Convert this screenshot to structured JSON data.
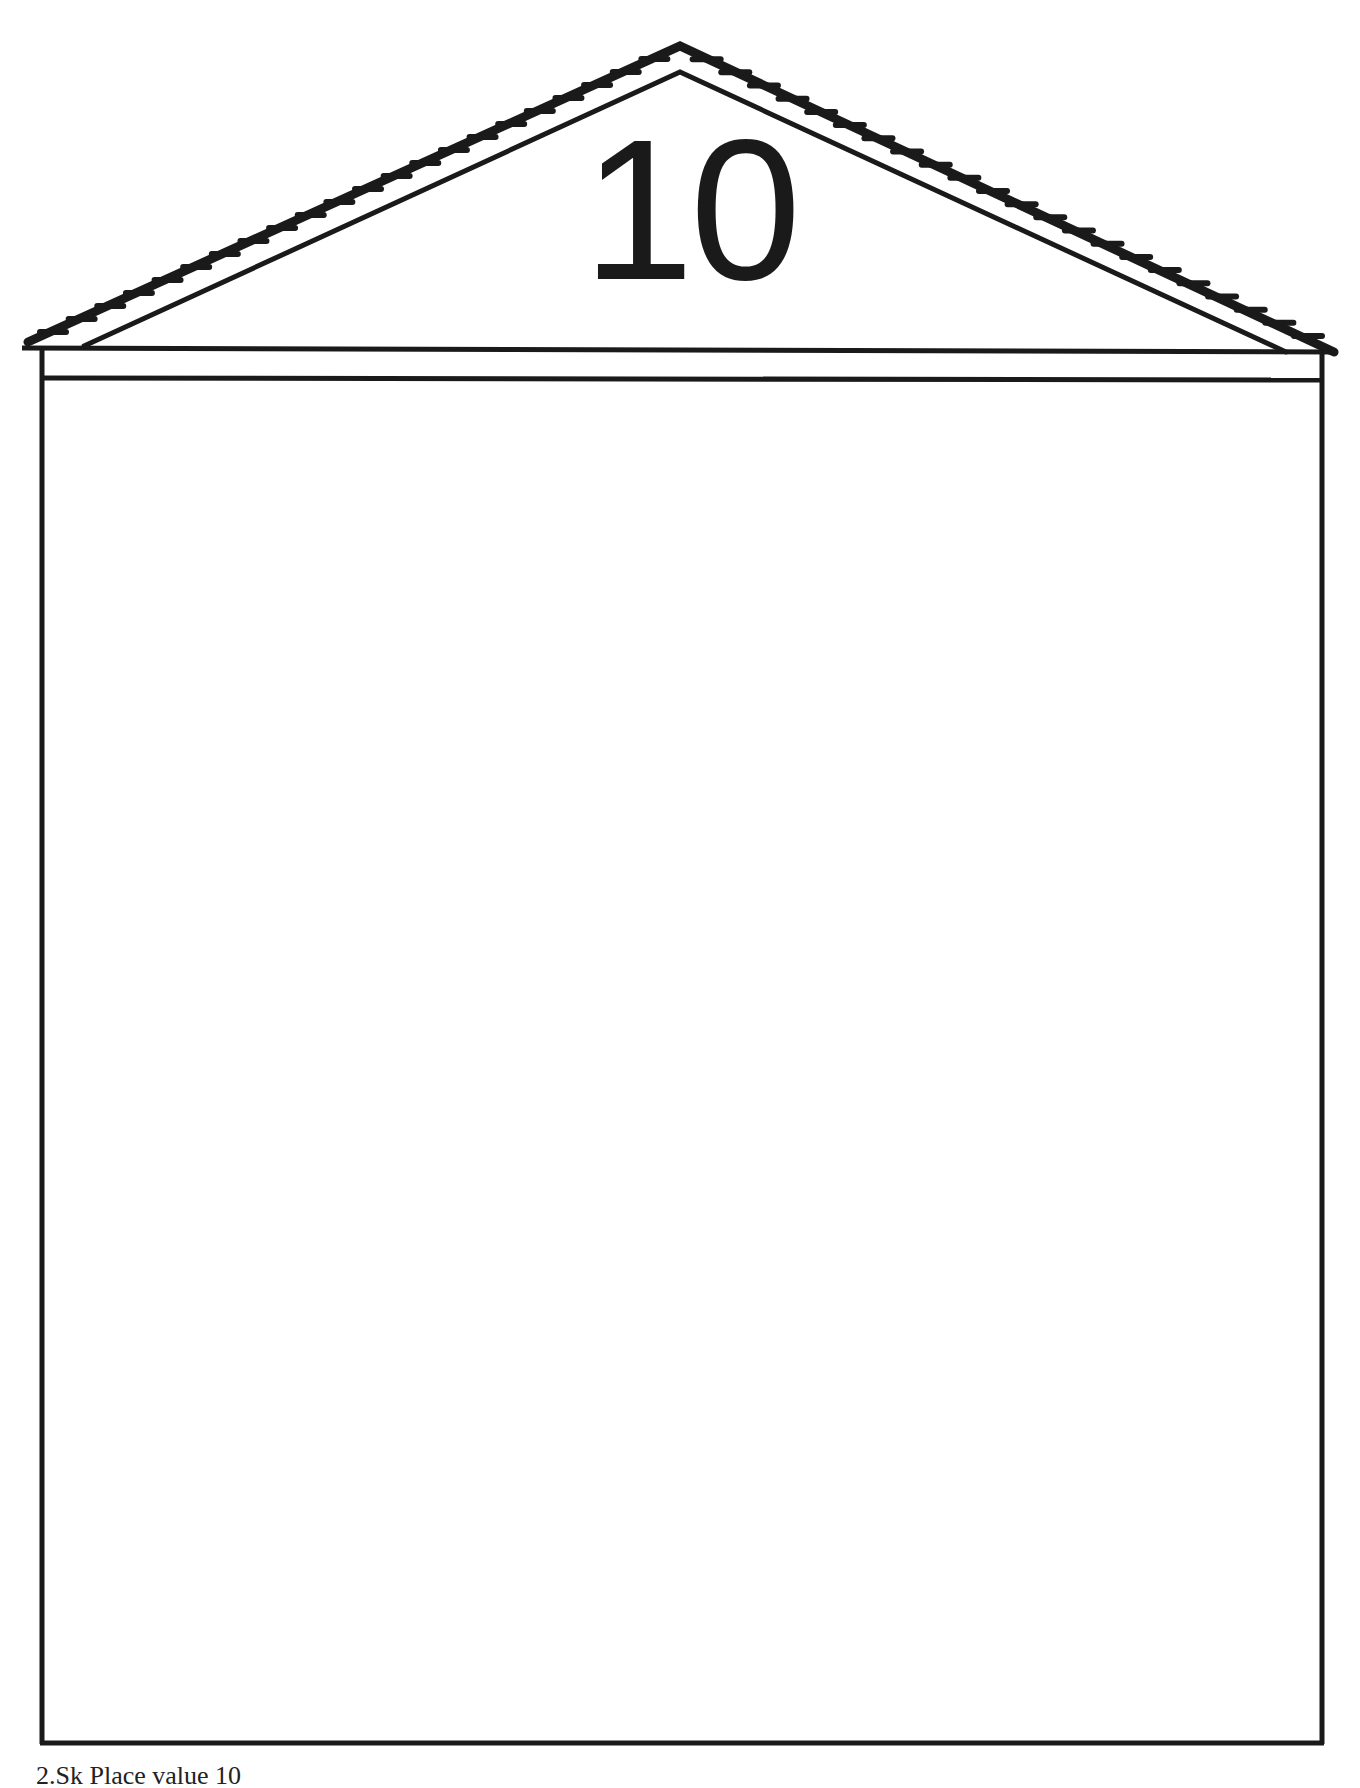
{
  "page": {
    "house_number": "10",
    "caption_partial": "2.Sk Place value 10"
  },
  "colors": {
    "ink": "#1a1a1a",
    "paper": "#ffffff"
  }
}
